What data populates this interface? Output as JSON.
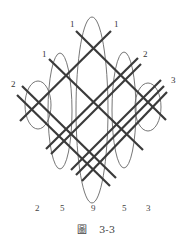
{
  "figure": {
    "caption": "圖　3-3",
    "caption_prefix": "圖",
    "caption_number": "3-3",
    "top_labels": {
      "left_group": [
        {
          "text": "2",
          "x": 11,
          "y": 87
        },
        {
          "text": "1",
          "x": 42,
          "y": 57
        },
        {
          "text": "1",
          "x": 70,
          "y": 27
        }
      ],
      "right_group": [
        {
          "text": "1",
          "x": 114,
          "y": 27
        },
        {
          "text": "2",
          "x": 143,
          "y": 57
        },
        {
          "text": "3",
          "x": 171,
          "y": 83
        }
      ]
    },
    "bottom_counts": [
      {
        "text": "2",
        "x": 37
      },
      {
        "text": "5",
        "x": 62
      },
      {
        "text": "9",
        "x": 93
      },
      {
        "text": "5",
        "x": 124
      },
      {
        "text": "3",
        "x": 148
      }
    ],
    "colors": {
      "line": "#3a3a3a",
      "ellipse": "#666666",
      "text": "#333333",
      "background": "#ffffff"
    }
  }
}
